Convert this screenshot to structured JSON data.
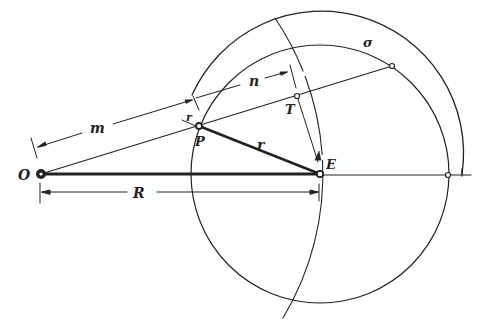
{
  "diagram": {
    "type": "geometric-construction",
    "colors": {
      "ink": "#222222",
      "background": "#ffffff"
    },
    "points": {
      "O": {
        "label": "O",
        "x": 41,
        "y": 174
      },
      "E": {
        "label": "E",
        "x": 320,
        "y": 174
      },
      "P": {
        "label": "P",
        "x": 199,
        "y": 126
      },
      "T": {
        "label": "T",
        "x": 297,
        "y": 96
      }
    },
    "segments": {
      "R": {
        "label": "R"
      },
      "r": {
        "label": "r"
      },
      "m": {
        "label": "m"
      },
      "n": {
        "label": "n"
      },
      "small_r": {
        "label": "r"
      }
    },
    "arcs": {
      "sigma": {
        "label": "σ"
      }
    }
  }
}
